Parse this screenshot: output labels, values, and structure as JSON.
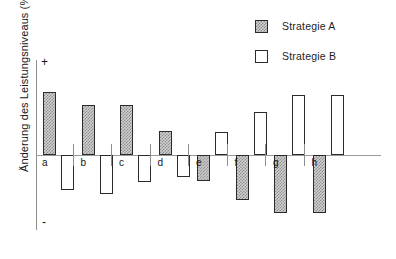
{
  "chart_data": {
    "type": "bar",
    "title": "",
    "subtitle": "",
    "xlabel": "",
    "ylabel": "Änderung des Leistungsniveaus (%)",
    "categories": [
      "a",
      "b",
      "c",
      "d",
      "e",
      "f",
      "g",
      "h"
    ],
    "series": [
      {
        "name": "Strategie A",
        "color": "#cfcfcf",
        "pattern": "hatched",
        "values": [
          60,
          48,
          48,
          23,
          -25,
          -43,
          -55,
          -55
        ]
      },
      {
        "name": "Strategie B",
        "color": "#ffffff",
        "pattern": "solid",
        "values": [
          -33,
          -37,
          -26,
          -21,
          22,
          41,
          57,
          57
        ]
      }
    ],
    "ylim": [
      -70,
      70
    ],
    "y_axis_markers": {
      "positive": "+",
      "negative": "-"
    },
    "grid": false,
    "legend_position": "top-right",
    "axis_tick_labels_shown": false,
    "group_separators": true
  },
  "legend": {
    "items": [
      {
        "label": "Strategie A",
        "swatch": "hatched-gray-square"
      },
      {
        "label": "Strategie B",
        "swatch": "white-square"
      }
    ]
  },
  "axis": {
    "y_title": "Änderung des Leistungsniveaus (%)",
    "plus_marker": "+",
    "minus_marker": "-"
  }
}
